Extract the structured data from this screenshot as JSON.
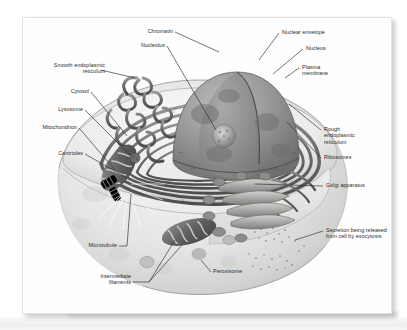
{
  "figure": {
    "style": "grayscale airbrush illustration with leader-line callouts",
    "panel_background": "#fefefe",
    "ink_color": "#2b2b2b"
  },
  "labels": {
    "chromatin": "Chromatin",
    "nucleolus": "Nucleolus",
    "nuclear_envelope": "Nuclear envelope",
    "nucleus": "Nucleus",
    "plasma_membrane": "Plasma\nmembrane",
    "smooth_er": "Smooth endoplasmic\nreticulum",
    "cytosol": "Cytosol",
    "lysosome": "Lysosome",
    "mitochondrion": "Mitochondrion",
    "centrioles": "Centrioles",
    "rough_er": "Rough\nendoplasmic\nreticulum",
    "ribosomes": "Ribosomes",
    "golgi_apparatus": "Golgi apparatus",
    "secretion": "Secretion being released\nfrom cell by exocytosis",
    "microtubule": "Microtubule",
    "intermediate_filaments": "Intermediate\nfilaments",
    "peroxisome": "Peroxisome"
  },
  "structures": [
    {
      "name": "nucleus",
      "description": "large cut-away dome at top center"
    },
    {
      "name": "nucleolus",
      "description": "dark granular sphere inside nucleus"
    },
    {
      "name": "chromatin",
      "description": "mottled texture filling nucleus interior"
    },
    {
      "name": "nuclear-envelope",
      "description": "double membrane bounding the nucleus"
    },
    {
      "name": "rough-endoplasmic-reticulum",
      "description": "concentric flattened cisternae wrapping the nucleus"
    },
    {
      "name": "smooth-endoplasmic-reticulum",
      "description": "branching tubular network at upper left"
    },
    {
      "name": "golgi-apparatus",
      "description": "stack of curved cisternae with vesicles at lower right"
    },
    {
      "name": "mitochondrion",
      "description": "two bean-shaped organelles with cristae at left"
    },
    {
      "name": "centrioles",
      "description": "paired cylinders near left mitochondrion"
    },
    {
      "name": "lysosome",
      "description": "small dark vesicle left of center"
    },
    {
      "name": "peroxisome",
      "description": "small round bodies in lower cytoplasm"
    },
    {
      "name": "microtubule",
      "description": "fine radiating fibers from centrosome"
    },
    {
      "name": "intermediate-filaments",
      "description": "fine fibers in lower cytoplasm"
    },
    {
      "name": "ribosomes",
      "description": "stippled dots on rough ER surface"
    },
    {
      "name": "plasma-membrane",
      "description": "outer boundary of the cell"
    },
    {
      "name": "cytosol",
      "description": "pale ground substance filling the cell"
    },
    {
      "name": "secretion-vesicles",
      "description": "stippled granules released outside membrane at right"
    }
  ]
}
